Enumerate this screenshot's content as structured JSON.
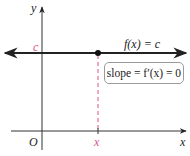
{
  "diagram": {
    "axes": {
      "y_label": "y",
      "x_label": "x",
      "origin_label": "O"
    },
    "function_label": "f(x) = c",
    "constant_label": "c",
    "point_x_label": "x",
    "slope_box": "slope = f′(x) = 0",
    "colors": {
      "axis": "#333333",
      "function_line": "#222222",
      "highlight": "#d9558e",
      "box_border": "#9a9a9a"
    }
  }
}
